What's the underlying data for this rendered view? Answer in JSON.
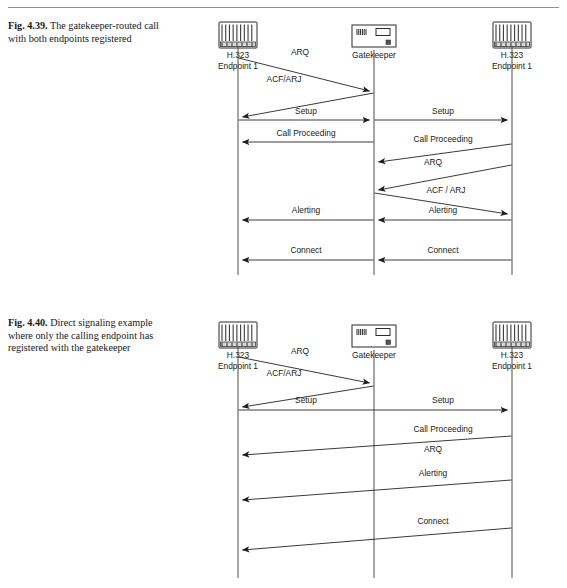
{
  "page": {
    "top_rule": true,
    "background": "#ffffff",
    "ink": "#1a1a1a"
  },
  "figures": [
    {
      "id": "fig-4-39",
      "caption_lead": "Fig. 4.39.",
      "caption_text": " The gatekeeper-routed call with both endpoints registered",
      "nodes": [
        {
          "name": "endpoint-left",
          "icon": "h323-endpoint-icon",
          "line1": "H.323",
          "line2": "Endpoint 1",
          "x": 58
        },
        {
          "name": "gatekeeper",
          "icon": "gatekeeper-icon",
          "line1": "Gatekeeper",
          "line2": "",
          "x": 194
        },
        {
          "name": "endpoint-right",
          "icon": "h323-endpoint-icon",
          "line1": "H.323",
          "line2": "Endpoint 1",
          "x": 332
        }
      ],
      "messages": [
        {
          "label": "ARQ",
          "from": "endpoint-left",
          "to": "gatekeeper",
          "y1": 48,
          "y2": 81,
          "label_x": 120,
          "label_y": 45
        },
        {
          "label": "ACF/ARJ",
          "from": "gatekeeper",
          "to": "endpoint-left",
          "y1": 83,
          "y2": 107,
          "label_x": 104,
          "label_y": 72
        },
        {
          "label": "Setup",
          "from": "endpoint-left",
          "to": "gatekeeper",
          "y1": 110,
          "y2": 110,
          "label_x": 126,
          "label_y": 104
        },
        {
          "label": "Setup",
          "from": "gatekeeper",
          "to": "endpoint-right",
          "y1": 110,
          "y2": 110,
          "label_x": 263,
          "label_y": 104
        },
        {
          "label": "Call Proceeding",
          "from": "gatekeeper",
          "to": "endpoint-left",
          "y1": 132,
          "y2": 132,
          "label_x": 126,
          "label_y": 126
        },
        {
          "label": "Call Proceeding",
          "from": "endpoint-right",
          "to": "gatekeeper",
          "y1": 134,
          "y2": 152,
          "label_x": 263,
          "label_y": 132
        },
        {
          "label": "ARQ",
          "from": "endpoint-right",
          "to": "gatekeeper",
          "y1": 155,
          "y2": 180,
          "label_x": 253,
          "label_y": 155
        },
        {
          "label": "ACF / ARJ",
          "from": "gatekeeper",
          "to": "endpoint-right",
          "y1": 183,
          "y2": 204,
          "label_x": 266,
          "label_y": 183
        },
        {
          "label": "Alerting",
          "from": "gatekeeper",
          "to": "endpoint-left",
          "y1": 210,
          "y2": 210,
          "label_x": 126,
          "label_y": 203
        },
        {
          "label": "Alerting",
          "from": "endpoint-right",
          "to": "gatekeeper",
          "y1": 210,
          "y2": 210,
          "label_x": 263,
          "label_y": 203
        },
        {
          "label": "Connect",
          "from": "gatekeeper",
          "to": "endpoint-left",
          "y1": 250,
          "y2": 250,
          "label_x": 126,
          "label_y": 243
        },
        {
          "label": "Connect",
          "from": "endpoint-right",
          "to": "gatekeeper",
          "y1": 250,
          "y2": 250,
          "label_x": 263,
          "label_y": 243
        }
      ]
    },
    {
      "id": "fig-4-40",
      "caption_lead": "Fig. 4.40.",
      "caption_text": " Direct signaling example where only the calling endpoint has registered with the gatekeeper",
      "nodes": [
        {
          "name": "endpoint-left",
          "icon": "h323-endpoint-icon",
          "line1": "H.323",
          "line2": "Endpoint 1",
          "x": 58
        },
        {
          "name": "gatekeeper",
          "icon": "gatekeeper-icon",
          "line1": "Gatekeeper",
          "line2": "",
          "x": 194
        },
        {
          "name": "endpoint-right",
          "icon": "h323-endpoint-icon",
          "line1": "H.323",
          "line2": "Endpoint 1",
          "x": 332
        }
      ],
      "messages": [
        {
          "label": "ARQ",
          "from": "endpoint-left",
          "to": "gatekeeper",
          "y1": 47,
          "y2": 73,
          "label_x": 120,
          "label_y": 44
        },
        {
          "label": "ACF/ARJ",
          "from": "gatekeeper",
          "to": "endpoint-left",
          "y1": 76,
          "y2": 97,
          "label_x": 104,
          "label_y": 66
        },
        {
          "label": "Setup",
          "from": "endpoint-left",
          "to": "endpoint-right",
          "y1": 100,
          "y2": 100,
          "label_x": 126,
          "label_y": 93
        },
        {
          "label": "Setup",
          "from": "endpoint-left",
          "to": "endpoint-right",
          "y1": 100,
          "y2": 100,
          "label_x": 263,
          "label_y": 93,
          "label_only": true
        },
        {
          "label": "Call Proceeding",
          "from": "endpoint-right",
          "to": "endpoint-left",
          "y1": 126,
          "y2": 145,
          "label_x": 263,
          "label_y": 122
        },
        {
          "label": "ARQ",
          "from": "endpoint-right",
          "to": "endpoint-left",
          "y1": 126,
          "y2": 145,
          "label_x": 253,
          "label_y": 142,
          "label_only": true
        },
        {
          "label": "Alerting",
          "from": "endpoint-right",
          "to": "endpoint-left",
          "y1": 170,
          "y2": 190,
          "label_x": 253,
          "label_y": 166
        },
        {
          "label": "Connect",
          "from": "endpoint-right",
          "to": "endpoint-left",
          "y1": 218,
          "y2": 240,
          "label_x": 253,
          "label_y": 214
        }
      ]
    }
  ]
}
